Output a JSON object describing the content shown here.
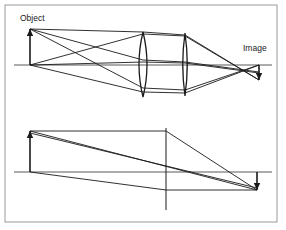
{
  "figure": {
    "background_color": "#ffffff",
    "line_color": "#1a1a1a",
    "axis_color": "#5a5a5a",
    "border_color": "#9a9a9a",
    "width": 286,
    "height": 230
  },
  "border": {
    "x": 5,
    "y": 5,
    "width": 272,
    "height": 217,
    "stroke_width": 1
  },
  "labels": {
    "object": "Object",
    "image": "Image",
    "object_x": 20,
    "object_y": 21,
    "image_x": 243,
    "image_y": 51
  },
  "top_panel": {
    "name": "two-lens-system",
    "axis": {
      "y": 65,
      "x_start": 14,
      "x_end": 272
    },
    "object_arrow": {
      "x": 30,
      "y_base": 65,
      "y_tip": 29,
      "direction": "up"
    },
    "image_arrow": {
      "x": 259,
      "y_base": 65,
      "y_tip": 80,
      "direction": "down"
    },
    "lens_1": {
      "name": "first-biconvex-lens",
      "center_x": 143,
      "top_y": 32,
      "bottom_y": 97,
      "bulge": 8
    },
    "lens_2": {
      "name": "second-biconvex-lens",
      "center_x": 185,
      "top_y": 33,
      "bottom_y": 96,
      "bulge": 4.5
    },
    "rays": [
      {
        "name": "ray-tip-upper",
        "points": "30,29 143,32 185,35 259,80"
      },
      {
        "name": "ray-tip-lower",
        "points": "30,29 143,88 185,90 259,65"
      },
      {
        "name": "ray-tip-middle",
        "points": "30,29 143,60 185,62 259,72"
      },
      {
        "name": "ray-base-upper",
        "points": "30,65 143,34 185,36 259,80"
      },
      {
        "name": "ray-base-lower",
        "points": "30,65 143,92 185,93 259,65"
      },
      {
        "name": "ray-base-middle",
        "points": "30,65 143,62 185,63 259,73"
      }
    ]
  },
  "bottom_panel": {
    "name": "equivalent-thin-lens-system",
    "axis": {
      "y": 172,
      "x_start": 14,
      "x_end": 272
    },
    "principal_plane": {
      "x": 166,
      "y_top": 128,
      "y_bottom": 210
    },
    "object_arrow": {
      "x": 30,
      "y_base": 172,
      "y_tip": 131,
      "direction": "up"
    },
    "image_arrow": {
      "x": 257,
      "y_base": 172,
      "y_tip": 190,
      "direction": "down"
    },
    "construction_lines": [
      {
        "name": "line-object-top-to-plane",
        "points": "30,131 166,131"
      },
      {
        "name": "line-plane-to-image-tip",
        "points": "166,131 257,190"
      },
      {
        "name": "line-image-base-horizontal",
        "points": "166,190 257,190"
      },
      {
        "name": "ray-chief-upper",
        "points": "30,131 257,190"
      },
      {
        "name": "ray-chief-lower",
        "points": "30,133 257,188"
      },
      {
        "name": "ray-parallel-in",
        "points": "30,172 166,190"
      }
    ]
  }
}
